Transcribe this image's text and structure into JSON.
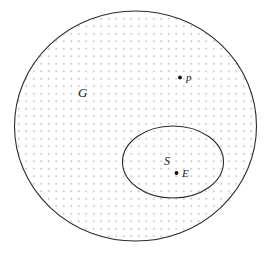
{
  "figure": {
    "background_color": "#ffffff",
    "stroke_color": "#2b2b2b",
    "fill_pattern": "dotted-grid",
    "fill_dot_color": "#b9b9b9",
    "fill_dot_spacing": 7.5,
    "fill_dot_radius": 0.85
  },
  "regions": [
    {
      "id": "outer",
      "label": "G",
      "shape": "ellipse",
      "cx": 135.5,
      "cy": 126,
      "rx": 121,
      "ry": 115,
      "stroke_width": 1.1,
      "label_x": 78,
      "label_y": 97,
      "label_size": 13
    },
    {
      "id": "inner",
      "label": "S",
      "shape": "ellipse",
      "cx": 173,
      "cy": 162,
      "rx": 50.5,
      "ry": 36,
      "stroke_width": 1.1,
      "label_x": 164,
      "label_y": 165,
      "label_size": 12
    }
  ],
  "points": [
    {
      "id": "p",
      "label": "p",
      "x": 180,
      "y": 77.5,
      "radius": 1.9,
      "label_x": 186,
      "label_y": 81,
      "label_size": 11
    },
    {
      "id": "E",
      "label": "E",
      "x": 176.5,
      "y": 173,
      "radius": 1.9,
      "label_x": 182,
      "label_y": 177,
      "label_size": 11
    }
  ]
}
